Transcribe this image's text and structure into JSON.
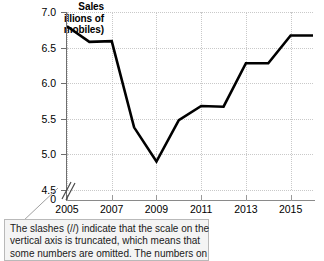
{
  "axis_title": {
    "line1": "Sales",
    "line2": "illions of",
    "line3": "mobiles)"
  },
  "caption": {
    "line1": "The slashes (//) indicate that the scale on the",
    "line2": "vertical axis is truncated, which means that",
    "line3": "some numbers are omitted.  The numbers on"
  },
  "colors": {
    "line": "#000000",
    "grid": "#c9c9c9",
    "axis": "#6f6f6f",
    "caption_background": "#f4f4f4",
    "caption_border": "#b9b9b9"
  },
  "chart_data": {
    "type": "line",
    "title": "",
    "xlabel": "",
    "ylabel": "Sales (millions of automobiles)",
    "grid": true,
    "legend": "none",
    "axis_truncated": true,
    "zero_tick_label": "0",
    "ylim": [
      4.5,
      7.0
    ],
    "yticks": [
      "4.5",
      "5.0",
      "5.5",
      "6.0",
      "6.5",
      "7.0"
    ],
    "ytick_values": [
      4.5,
      5.0,
      5.5,
      6.0,
      6.5,
      7.0
    ],
    "xlim": [
      2005,
      2016
    ],
    "xticks": [
      "2005",
      "2007",
      "2009",
      "2011",
      "2013",
      "2015"
    ],
    "xtick_values": [
      2005,
      2007,
      2009,
      2011,
      2013,
      2015
    ],
    "x": [
      2005,
      2006,
      2007,
      2008,
      2009,
      2010,
      2011,
      2012,
      2013,
      2014,
      2015,
      2016
    ],
    "values": [
      6.8,
      6.58,
      6.59,
      5.38,
      4.9,
      5.48,
      5.68,
      5.67,
      6.28,
      6.28,
      6.67,
      6.67
    ]
  }
}
